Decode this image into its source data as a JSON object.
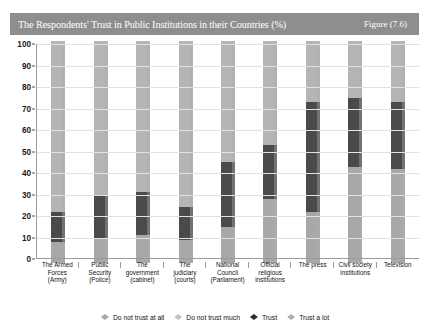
{
  "title": {
    "text": "The Respondents' Trust in Public Institutions in their Countries (%)",
    "figure_label": "Figure (7.6)",
    "bar_color": "#8e8e8e",
    "text_color": "#ffffff"
  },
  "chart_data": {
    "type": "bar",
    "subtype": "stacked-bar-100",
    "title": "The Respondents' Trust in Public Institutions in their Countries (%)",
    "xlabel": "",
    "ylabel": "",
    "ylim": [
      0,
      100
    ],
    "yticks": [
      0,
      10,
      20,
      30,
      40,
      50,
      60,
      70,
      80,
      90,
      100
    ],
    "ytick_labels": [
      "0",
      "10",
      "20",
      "30",
      "40",
      "50",
      "60",
      "70",
      "80",
      "90",
      "100"
    ],
    "grid": true,
    "legend_position": "bottom",
    "categories": [
      "The Armed Forces (Army)",
      "Public Security (Police)",
      "The government (cabinet)",
      "The judiciary (courts)",
      "National Council (Parliament)",
      "Official religious institutions",
      "The press",
      "Civil society institutions",
      "Television"
    ],
    "category_lines": [
      [
        "The Armed",
        "Forces",
        "(Army)"
      ],
      [
        "Public",
        "Security",
        "(Police)"
      ],
      [
        "The",
        "government",
        "(cabinet)"
      ],
      [
        "The",
        "judiciary",
        "(courts)"
      ],
      [
        "National",
        "Council",
        "(Parliament)"
      ],
      [
        "Official",
        "religious",
        "institutions"
      ],
      [
        "The press"
      ],
      [
        "Civil society",
        "institutions"
      ],
      [
        "Television"
      ]
    ],
    "series": [
      {
        "name": "Do not trust at all",
        "color": "#a8a8a8",
        "values": [
          8,
          10,
          11,
          9,
          15,
          28,
          22,
          43,
          42
        ]
      },
      {
        "name": "Do not trust much",
        "color": "#9c9c9c",
        "values": [
          0,
          0,
          0,
          0,
          0,
          0,
          0,
          0,
          0
        ]
      },
      {
        "name": "Trust",
        "color": "#4a4a4a",
        "values": [
          14,
          20,
          20,
          15,
          30,
          25,
          51,
          32,
          31
        ]
      },
      {
        "name": "Trust a lot",
        "color": "#b5b5b5",
        "values": [
          78,
          70,
          69,
          76,
          55,
          47,
          27,
          25,
          27
        ]
      }
    ]
  },
  "legend": [
    {
      "label": "Do not trust at all",
      "color": "#a8a8a8",
      "marker": "diamond-marker"
    },
    {
      "label": "Do not trust much",
      "color": "#c2c2c2",
      "marker": "diamond-marker"
    },
    {
      "label": "Trust",
      "color": "#2f2f2f",
      "marker": "diamond-marker"
    },
    {
      "label": "Trust a lot",
      "color": "#b0b0b0",
      "marker": "diamond-marker"
    }
  ]
}
